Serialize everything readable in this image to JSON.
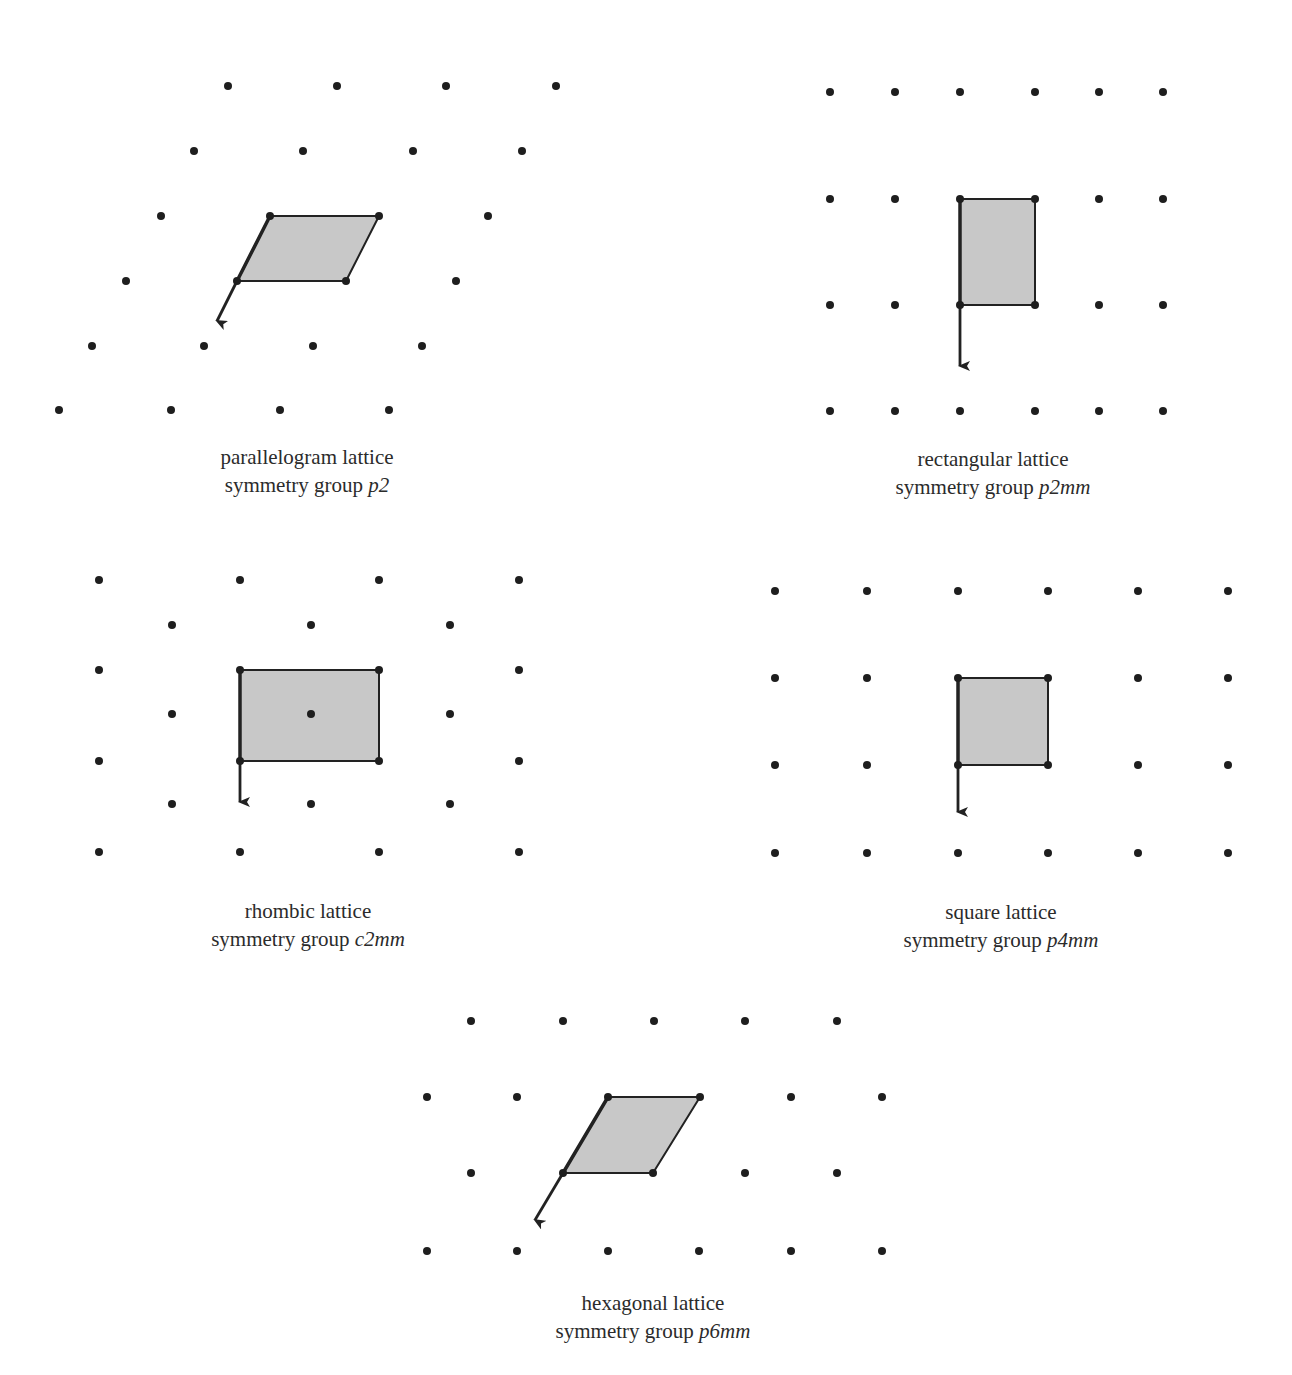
{
  "colors": {
    "dot": "#1e1e1e",
    "fill": "#c8c8c8",
    "edge": "#222222",
    "text": "#2b2b2b"
  },
  "panels": [
    {
      "id": "parallelogram",
      "caption": {
        "line1": "parallelogram lattice",
        "prefix": "symmetry group ",
        "group": "p2",
        "x": 307,
        "y": 443
      },
      "dots": [
        [
          228,
          86
        ],
        [
          337,
          86
        ],
        [
          446,
          86
        ],
        [
          556,
          86
        ],
        [
          194,
          151
        ],
        [
          303,
          151
        ],
        [
          413,
          151
        ],
        [
          522,
          151
        ],
        [
          161,
          216
        ],
        [
          270,
          216
        ],
        [
          379,
          216
        ],
        [
          488,
          216
        ],
        [
          126,
          281
        ],
        [
          237,
          281
        ],
        [
          346,
          281
        ],
        [
          456,
          281
        ],
        [
          92,
          346
        ],
        [
          204,
          346
        ],
        [
          313,
          346
        ],
        [
          422,
          346
        ],
        [
          59,
          410
        ],
        [
          171,
          410
        ],
        [
          280,
          410
        ],
        [
          389,
          410
        ]
      ],
      "cell": [
        [
          270,
          216
        ],
        [
          379,
          216
        ],
        [
          346,
          281
        ],
        [
          237,
          281
        ]
      ],
      "bold_edge": [
        [
          270,
          216
        ],
        [
          237,
          281
        ]
      ],
      "arrow": {
        "from": [
          237,
          281
        ],
        "to": [
          217,
          321
        ]
      }
    },
    {
      "id": "rectangular",
      "caption": {
        "line1": "rectangular lattice",
        "prefix": "symmetry group ",
        "group": "p2mm",
        "x": 993,
        "y": 445
      },
      "dots": [
        [
          830,
          92
        ],
        [
          895,
          92
        ],
        [
          960,
          92
        ],
        [
          1035,
          92
        ],
        [
          1099,
          92
        ],
        [
          1163,
          92
        ],
        [
          830,
          199
        ],
        [
          895,
          199
        ],
        [
          960,
          199
        ],
        [
          1035,
          199
        ],
        [
          1099,
          199
        ],
        [
          1163,
          199
        ],
        [
          830,
          305
        ],
        [
          895,
          305
        ],
        [
          960,
          305
        ],
        [
          1035,
          305
        ],
        [
          1099,
          305
        ],
        [
          1163,
          305
        ],
        [
          830,
          411
        ],
        [
          895,
          411
        ],
        [
          960,
          411
        ],
        [
          1035,
          411
        ],
        [
          1099,
          411
        ],
        [
          1163,
          411
        ]
      ],
      "cell": [
        [
          960,
          199
        ],
        [
          1035,
          199
        ],
        [
          1035,
          305
        ],
        [
          960,
          305
        ]
      ],
      "bold_edge": [
        [
          960,
          199
        ],
        [
          960,
          305
        ]
      ],
      "arrow": {
        "from": [
          960,
          305
        ],
        "to": [
          960,
          366
        ]
      }
    },
    {
      "id": "rhombic",
      "caption": {
        "line1": "rhombic lattice",
        "prefix": "symmetry group ",
        "group": "c2mm",
        "x": 308,
        "y": 897
      },
      "dots": [
        [
          99,
          580
        ],
        [
          240,
          580
        ],
        [
          379,
          580
        ],
        [
          519,
          580
        ],
        [
          172,
          625
        ],
        [
          311,
          625
        ],
        [
          450,
          625
        ],
        [
          99,
          670
        ],
        [
          240,
          670
        ],
        [
          379,
          670
        ],
        [
          519,
          670
        ],
        [
          172,
          714
        ],
        [
          311,
          714
        ],
        [
          450,
          714
        ],
        [
          99,
          761
        ],
        [
          240,
          761
        ],
        [
          379,
          761
        ],
        [
          519,
          761
        ],
        [
          172,
          804
        ],
        [
          311,
          804
        ],
        [
          450,
          804
        ],
        [
          99,
          852
        ],
        [
          240,
          852
        ],
        [
          379,
          852
        ],
        [
          519,
          852
        ]
      ],
      "cell": [
        [
          240,
          670
        ],
        [
          379,
          670
        ],
        [
          379,
          761
        ],
        [
          240,
          761
        ]
      ],
      "bold_edge": [
        [
          240,
          670
        ],
        [
          240,
          761
        ]
      ],
      "arrow": {
        "from": [
          240,
          761
        ],
        "to": [
          240,
          802
        ]
      }
    },
    {
      "id": "square",
      "caption": {
        "line1": "square lattice",
        "prefix": "symmetry group ",
        "group": "p4mm",
        "x": 1001,
        "y": 898
      },
      "dots": [
        [
          775,
          591
        ],
        [
          867,
          591
        ],
        [
          958,
          591
        ],
        [
          1048,
          591
        ],
        [
          1138,
          591
        ],
        [
          1228,
          591
        ],
        [
          775,
          678
        ],
        [
          867,
          678
        ],
        [
          958,
          678
        ],
        [
          1048,
          678
        ],
        [
          1138,
          678
        ],
        [
          1228,
          678
        ],
        [
          775,
          765
        ],
        [
          867,
          765
        ],
        [
          958,
          765
        ],
        [
          1048,
          765
        ],
        [
          1138,
          765
        ],
        [
          1228,
          765
        ],
        [
          775,
          853
        ],
        [
          867,
          853
        ],
        [
          958,
          853
        ],
        [
          1048,
          853
        ],
        [
          1138,
          853
        ],
        [
          1228,
          853
        ]
      ],
      "cell": [
        [
          958,
          678
        ],
        [
          1048,
          678
        ],
        [
          1048,
          765
        ],
        [
          958,
          765
        ]
      ],
      "bold_edge": [
        [
          958,
          678
        ],
        [
          958,
          765
        ]
      ],
      "arrow": {
        "from": [
          958,
          765
        ],
        "to": [
          958,
          812
        ]
      }
    },
    {
      "id": "hexagonal",
      "caption": {
        "line1": "hexagonal lattice",
        "prefix": "symmetry group ",
        "group": "p6mm",
        "x": 653,
        "y": 1289
      },
      "dots": [
        [
          471,
          1021
        ],
        [
          563,
          1021
        ],
        [
          654,
          1021
        ],
        [
          745,
          1021
        ],
        [
          837,
          1021
        ],
        [
          427,
          1097
        ],
        [
          517,
          1097
        ],
        [
          608,
          1097
        ],
        [
          700,
          1097
        ],
        [
          791,
          1097
        ],
        [
          882,
          1097
        ],
        [
          471,
          1173
        ],
        [
          563,
          1173
        ],
        [
          653,
          1173
        ],
        [
          745,
          1173
        ],
        [
          837,
          1173
        ],
        [
          427,
          1251
        ],
        [
          517,
          1251
        ],
        [
          608,
          1251
        ],
        [
          699,
          1251
        ],
        [
          791,
          1251
        ],
        [
          882,
          1251
        ]
      ],
      "cell": [
        [
          608,
          1097
        ],
        [
          700,
          1097
        ],
        [
          653,
          1173
        ],
        [
          563,
          1173
        ]
      ],
      "bold_edge": [
        [
          608,
          1097
        ],
        [
          563,
          1173
        ]
      ],
      "arrow": {
        "from": [
          563,
          1173
        ],
        "to": [
          535,
          1220
        ]
      }
    }
  ]
}
